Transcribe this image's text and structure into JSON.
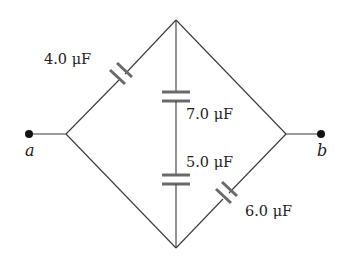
{
  "diagram": {
    "type": "capacitor-network",
    "terminals": [
      {
        "id": "a",
        "label": "a"
      },
      {
        "id": "b",
        "label": "b"
      }
    ],
    "capacitors": [
      {
        "id": "c4",
        "label": "4.0 μF",
        "value": 4.0,
        "unit": "μF",
        "branch": "left-junction to top-node"
      },
      {
        "id": "c7",
        "label": "7.0 μF",
        "value": 7.0,
        "unit": "μF",
        "branch": "top-node to middle (vertical)"
      },
      {
        "id": "c5",
        "label": "5.0 μF",
        "value": 5.0,
        "unit": "μF",
        "branch": "middle to bottom-node (vertical)"
      },
      {
        "id": "c6",
        "label": "6.0 μF",
        "value": 6.0,
        "unit": "μF",
        "branch": "bottom-node to right-junction"
      }
    ],
    "colors": {
      "wire": "#3a3a3a",
      "plate": "#6a6a6a",
      "terminal": "#111111",
      "background": "#ffffff"
    }
  }
}
